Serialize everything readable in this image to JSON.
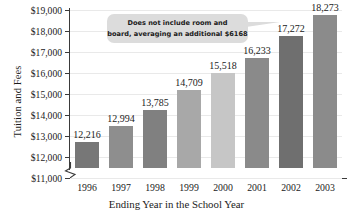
{
  "chart_data": {
    "type": "bar",
    "title": "",
    "xlabel": "Ending Year in the School Year",
    "ylabel": "Tuition and Fees",
    "categories": [
      "1996",
      "1997",
      "1998",
      "1999",
      "2000",
      "2001",
      "2002",
      "2003"
    ],
    "values": [
      12216,
      12994,
      13785,
      14709,
      15518,
      16233,
      17272,
      18273
    ],
    "value_labels": [
      "12,216",
      "12,994",
      "13,785",
      "14,709",
      "15,518",
      "16,233",
      "17,272",
      "18,273"
    ],
    "ylim": [
      11000,
      19000
    ],
    "axis_break": true,
    "grid": true,
    "legend": "none",
    "ytick_labels": [
      "$19,000",
      "$18,000",
      "$17,000",
      "$16,000",
      "$15,000",
      "$14,000",
      "$13,000",
      "$12,000",
      "$11,000"
    ],
    "ytick_values": [
      19000,
      18000,
      17000,
      16000,
      15000,
      14000,
      13000,
      12000,
      11000
    ],
    "bar_colors": [
      "#777777",
      "#8e8e8e",
      "#808080",
      "#a8a8a8",
      "#c6c6c6",
      "#8a8a8a",
      "#6f6f6f",
      "#8b8b8b"
    ],
    "annotations": [
      {
        "name": "room-and-board-note",
        "line1": "Does not include room and",
        "line2": "board, averaging an additional $6168",
        "background": "#dcdcdc"
      }
    ]
  }
}
